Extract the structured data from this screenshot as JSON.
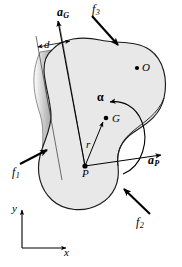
{
  "figure": {
    "background_color": "#ffffff",
    "body_fill_color": "#e8e8e8",
    "body_edge_color": "#1a1a1a",
    "shade_band_color": "#9a9a9a",
    "width": 182,
    "height": 267
  },
  "labels": {
    "a_G": {
      "text": "a",
      "sub": "G",
      "name": "acceleration-of-center-of-mass"
    },
    "a_P": {
      "text": "a",
      "sub": "P",
      "name": "acceleration-of-point-p"
    },
    "f_1": {
      "text": "f",
      "sub": "1",
      "name": "force-one"
    },
    "f_2": {
      "text": "f",
      "sub": "2",
      "name": "force-two"
    },
    "f_3": {
      "text": "f",
      "sub": "3",
      "name": "force-three"
    },
    "d": {
      "text": "d",
      "name": "perpendicular-distance"
    },
    "r": {
      "text": "r",
      "name": "position-vector-p-to-g"
    },
    "alpha": {
      "text": "α",
      "name": "angular-acceleration"
    },
    "G": {
      "text": "G",
      "name": "center-of-mass-point"
    },
    "P": {
      "text": "P",
      "name": "reference-point-p"
    },
    "O": {
      "text": "O",
      "name": "fixed-point-o"
    },
    "x": {
      "text": "x",
      "name": "x-axis-label"
    },
    "y": {
      "text": "y",
      "name": "y-axis-label"
    }
  },
  "points": {
    "G": {
      "x": 106,
      "y": 118
    },
    "P": {
      "x": 85,
      "y": 166
    },
    "O": {
      "x": 137,
      "y": 68
    }
  },
  "vectors": {
    "a_G": {
      "from": [
        85,
        166
      ],
      "to": [
        58,
        20
      ],
      "arrow": true
    },
    "a_P": {
      "from": [
        85,
        166
      ],
      "to": [
        162,
        155
      ],
      "arrow": true
    },
    "r": {
      "from": [
        85,
        166
      ],
      "to": [
        103,
        121
      ],
      "arrow": true
    },
    "f_1": {
      "from": [
        22,
        163
      ],
      "to": [
        48,
        150
      ],
      "arrow": true
    },
    "f_2": {
      "from": [
        148,
        213
      ],
      "to": [
        125,
        190
      ],
      "arrow": true
    },
    "f_3": {
      "from": [
        94,
        18
      ],
      "to": [
        117,
        45
      ],
      "arrow": true
    },
    "d_dimension": {
      "from": [
        36,
        48
      ],
      "to": [
        70,
        42
      ],
      "arrow": "both"
    },
    "alpha_arc": {
      "direction": "counterclockwise"
    }
  },
  "axes": {
    "origin": [
      22,
      248
    ],
    "x_end": [
      68,
      248
    ],
    "y_end": [
      22,
      208
    ]
  }
}
